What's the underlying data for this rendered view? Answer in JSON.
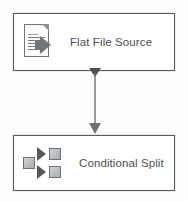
{
  "diagram": {
    "background_color": "#fdfdfd",
    "nodes": [
      {
        "id": "flat-file-source",
        "label": "Flat File Source",
        "icon": "flat-file-source-icon",
        "x": 13,
        "y": 13,
        "width": 162,
        "height": 58,
        "border_color": "#555b5e",
        "fill_color": "#ffffff",
        "text_color": "#4a4f52"
      },
      {
        "id": "conditional-split",
        "label": "Conditional Split",
        "icon": "conditional-split-icon",
        "x": 13,
        "y": 135,
        "width": 162,
        "height": 56,
        "border_color": "#555b5e",
        "fill_color": "#ffffff",
        "text_color": "#4a4f52"
      }
    ],
    "connector": {
      "id": "data-flow-path",
      "label": "",
      "from": "flat-file-source",
      "to": "conditional-split",
      "start_x": 95,
      "start_y": 71,
      "end_x": 95,
      "end_y": 135,
      "line_color": "#6d7275",
      "start_marker": "triangle-down",
      "end_marker": "arrowhead-down"
    }
  }
}
